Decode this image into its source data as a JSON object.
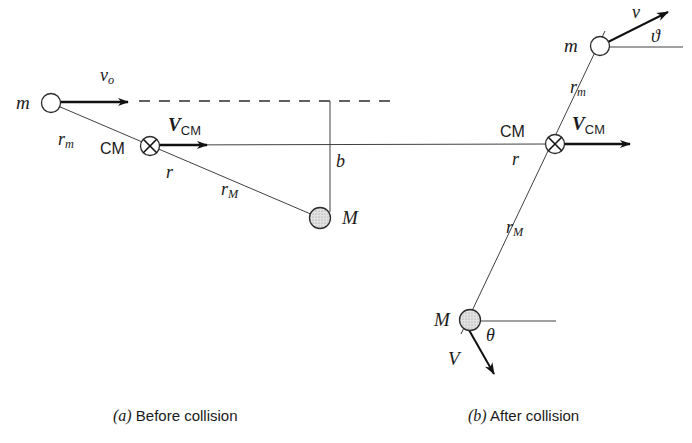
{
  "figure": {
    "background_color": "#ffffff",
    "ink_color": "#1a1a1a"
  },
  "panel_a": {
    "caption_tag": "(a)",
    "caption_text": "Before collision",
    "labels": {
      "small_mass": "m",
      "large_mass": "M",
      "center_of_mass": "CM",
      "initial_velocity": "v",
      "initial_velocity_sub": "o",
      "cm_velocity": "V",
      "cm_velocity_sub": "CM",
      "radius_m": "r",
      "radius_m_sub": "m",
      "radius_M": "r",
      "radius_M_sub": "M",
      "separation": "r",
      "impact_parameter": "b"
    }
  },
  "panel_b": {
    "caption_tag": "(b)",
    "caption_text": "After collision",
    "labels": {
      "small_mass": "m",
      "large_mass": "M",
      "center_of_mass": "CM",
      "final_velocity_small": "v",
      "final_velocity_large": "V",
      "cm_velocity": "V",
      "cm_velocity_sub": "CM",
      "radius_m": "r",
      "radius_m_sub": "m",
      "radius_M": "r",
      "radius_M_sub": "M",
      "separation": "r",
      "angle_small": "ϑ",
      "angle_large": "θ"
    }
  },
  "geometry": {
    "panel_a": {
      "ball_m": {
        "cx": 51,
        "cy": 103,
        "r": 9.5,
        "style": "open"
      },
      "ball_M": {
        "cx": 320,
        "cy": 218,
        "r": 10.5,
        "style": "filled"
      },
      "cm": {
        "cx": 150,
        "cy": 146,
        "r": 9.5
      },
      "dashed_line": {
        "x1": 139,
        "y1": 101,
        "x2": 396,
        "y2": 101
      },
      "vo_arrow": {
        "x1": 60,
        "y1": 102,
        "x2": 134,
        "y2": 102
      },
      "vcm_arrow": {
        "x1": 159,
        "y1": 145,
        "x2": 214,
        "y2": 145
      },
      "rod_line": {
        "x1": 51,
        "y1": 103,
        "x2": 320,
        "y2": 218
      },
      "b_line": {
        "x1": 330,
        "y1": 101,
        "x2": 330,
        "y2": 213
      }
    },
    "panel_b": {
      "ball_m": {
        "cx": 600,
        "cy": 46,
        "r": 9.5,
        "style": "open"
      },
      "ball_M": {
        "cx": 470,
        "cy": 320,
        "r": 10.5,
        "style": "filled"
      },
      "cm": {
        "cx": 555,
        "cy": 144,
        "r": 9.5
      },
      "rod_line": {
        "x1": 604,
        "y1": 33,
        "x2": 462,
        "y2": 333
      },
      "v_arrow": {
        "x1": 604,
        "y1": 44,
        "x2": 674,
        "y2": 9
      },
      "V_arrow": {
        "x1": 470,
        "y1": 330,
        "x2": 500,
        "y2": 383
      },
      "vcm_arrow": {
        "x1": 564,
        "y1": 144,
        "x2": 638,
        "y2": 144
      },
      "ref_line_m": {
        "x1": 600,
        "y1": 47,
        "x2": 683,
        "y2": 47
      },
      "ref_line_M": {
        "x1": 470,
        "y1": 321,
        "x2": 556,
        "y2": 321
      }
    },
    "shared": {
      "cm_axis": {
        "x1": 150,
        "y1": 145,
        "x2": 555,
        "y2": 144
      }
    }
  }
}
